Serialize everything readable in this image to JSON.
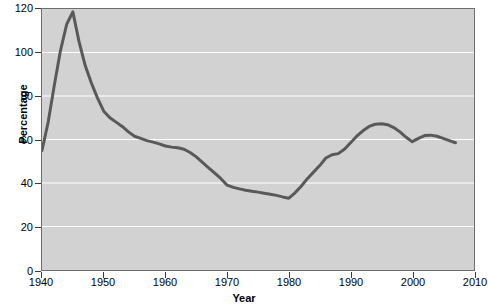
{
  "chart_data": {
    "type": "line",
    "title": "",
    "xlabel": "Year",
    "ylabel": "Percentage",
    "xlim": [
      1940,
      2010
    ],
    "ylim": [
      0,
      120
    ],
    "xticks": [
      1940,
      1950,
      1960,
      1970,
      1980,
      1990,
      2000,
      2010
    ],
    "yticks": [
      0,
      20,
      40,
      60,
      80,
      100,
      120
    ],
    "grid": "horizontal-white",
    "legend": "none",
    "line_color": "#595959",
    "panel_color": "#d2d2d2",
    "gridline_color": "#ffffff",
    "series": [
      {
        "name": "Percentage",
        "x": [
          1940,
          1941,
          1942,
          1943,
          1944,
          1945,
          1946,
          1947,
          1948,
          1949,
          1950,
          1951,
          1952,
          1953,
          1954,
          1955,
          1956,
          1957,
          1958,
          1959,
          1960,
          1961,
          1962,
          1963,
          1964,
          1965,
          1966,
          1967,
          1968,
          1969,
          1970,
          1971,
          1972,
          1973,
          1974,
          1975,
          1976,
          1977,
          1978,
          1979,
          1980,
          1981,
          1982,
          1983,
          1984,
          1985,
          1986,
          1987,
          1988,
          1989,
          1990,
          1991,
          1992,
          1993,
          1994,
          1995,
          1996,
          1997,
          1998,
          1999,
          2000,
          2001,
          2002,
          2003,
          2004,
          2005,
          2006,
          2007
        ],
        "values": [
          55.0,
          68.0,
          85.0,
          101.0,
          113.0,
          118.7,
          105.0,
          94.0,
          86.0,
          79.0,
          73.0,
          70.0,
          68.0,
          66.0,
          63.5,
          61.5,
          60.5,
          59.5,
          58.8,
          58.0,
          57.0,
          56.5,
          56.2,
          55.5,
          54.0,
          52.0,
          49.5,
          47.0,
          44.5,
          42.0,
          39.0,
          38.0,
          37.3,
          36.7,
          36.2,
          35.8,
          35.3,
          34.8,
          34.3,
          33.6,
          33.0,
          35.5,
          38.5,
          42.0,
          45.0,
          48.0,
          51.5,
          53.0,
          53.5,
          55.5,
          58.5,
          61.5,
          64.0,
          66.0,
          67.0,
          67.2,
          66.8,
          65.5,
          63.5,
          61.0,
          59.0,
          60.5,
          61.8,
          62.0,
          61.5,
          60.5,
          59.5,
          58.5
        ]
      }
    ]
  }
}
